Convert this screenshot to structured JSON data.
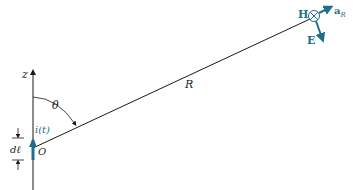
{
  "diagram": {
    "type": "physics-diagram",
    "labels": {
      "z_axis": "z",
      "angle": "θ",
      "distance": "R",
      "current": "i(t)",
      "element_length": "dℓ",
      "origin": "O",
      "magnetic_field": "H",
      "electric_field": "E",
      "radial_unit_vector": "a",
      "radial_unit_subscript": "R"
    },
    "colors": {
      "line": "#1a1a1a",
      "accent": "#1f6f8b",
      "text": "#1a1a1a"
    }
  }
}
